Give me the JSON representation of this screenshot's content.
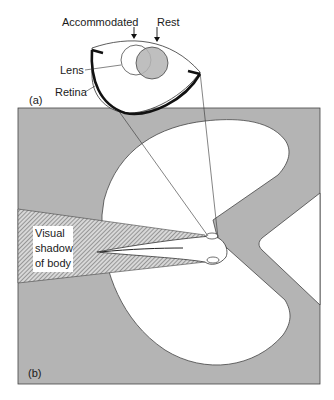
{
  "panel_a": {
    "tag": "(a)",
    "labels": {
      "accommodated": "Accommodated",
      "rest": "Rest",
      "lens": "Lens",
      "retina": "Retina"
    }
  },
  "panel_b": {
    "tag": "(b)",
    "shadow_label_lines": [
      "Visual",
      "shadow",
      "of body"
    ]
  },
  "colors": {
    "background": "#ffffff",
    "water_grey": "#b4b4b4",
    "line": "#333333",
    "lens_rest_fill": "#b4b4b4"
  }
}
